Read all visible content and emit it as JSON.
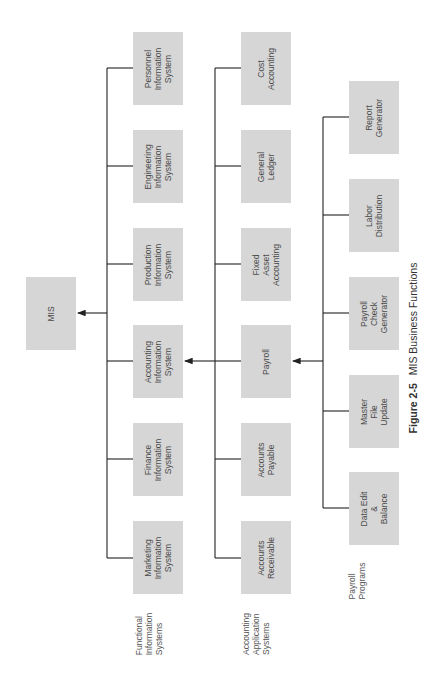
{
  "diagram": {
    "root": {
      "label": "MIS"
    },
    "functional_information_systems": {
      "group_label": "Functional\nInformation\nSystems",
      "items": [
        "Personnel\nInformation\nSystem",
        "Engineering\nInformation\nSystem",
        "Production\nInformation\nSystem",
        "Accounting\nInformation\nSystem",
        "Finance\nInformation\nSystem",
        "Marketing\nInformation\nSystem"
      ]
    },
    "accounting_application_systems": {
      "group_label": "Accounting\nApplication\nSystems",
      "items": [
        "Cost\nAccounting",
        "General\nLedger",
        "Fixed\nAsset\nAccounting",
        "Payroll",
        "Accounts\nPayable",
        "Accounts\nReceivable"
      ]
    },
    "payroll_programs": {
      "group_label": "Payroll\nPrograms",
      "items": [
        "Report\nGenerator",
        "Labor\nDistribution",
        "Payroll\nCheck\nGenerator",
        "Master\nFile\nUpdate",
        "Data Edit\n&\nBalance"
      ]
    },
    "edges": [
      {
        "from": "Functional Information Systems",
        "to": "MIS"
      },
      {
        "from": "Accounting Application Systems",
        "to": "Accounting Information System"
      },
      {
        "from": "Payroll Programs",
        "to": "Payroll"
      }
    ]
  },
  "caption": {
    "figure_number": "Figure 2-5",
    "title": "MIS Business Functions"
  },
  "colors": {
    "box_fill": "#d6d6d6",
    "line": "#222222",
    "text": "#3a3a3a"
  }
}
